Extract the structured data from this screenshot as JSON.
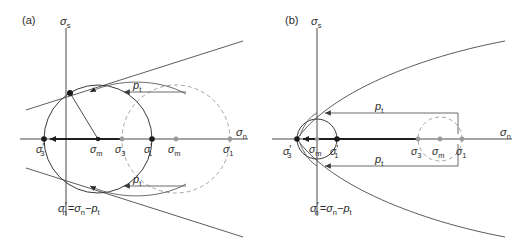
{
  "figure": {
    "background_color": "#ffffff",
    "ink_color": "#2b2b2b",
    "dashed_color": "#9a9a9a"
  },
  "panels": [
    {
      "id": "a",
      "label": "(a)",
      "envelope_type": "linear-coulomb",
      "axes": {
        "y_label_sigma": "σ",
        "y_label_sub": "s",
        "x_label_sigma": "σ",
        "x_label_sub": "n"
      },
      "equation": {
        "lhs_sigma": "σ",
        "lhs_sub": "n",
        "lhs_prime": "′",
        "eq": "=",
        "rhs_sigma": "σ",
        "rhs_sub": "n",
        "minus": "−",
        "p": "p",
        "p_sub": "t"
      },
      "shift_arrows": [
        {
          "name": "upper-pf-arrow",
          "label_p": "p",
          "label_sub": "t"
        },
        {
          "name": "lower-pf-arrow",
          "label_p": "p",
          "label_sub": "t"
        }
      ],
      "points": [
        {
          "name": "sigma-3-prime",
          "sigma": "σ",
          "sub": "3",
          "prime": "′",
          "style": "solid",
          "x": 44
        },
        {
          "name": "sigma-m-prime",
          "sigma": "σ",
          "sub": "m",
          "prime": "′",
          "style": "solid",
          "x": 98
        },
        {
          "name": "sigma-3",
          "sigma": "σ",
          "sub": "3",
          "prime": "",
          "style": "open",
          "x": 122
        },
        {
          "name": "sigma-1-prime",
          "sigma": "σ",
          "sub": "1",
          "prime": "′",
          "style": "solid",
          "x": 152
        },
        {
          "name": "sigma-m",
          "sigma": "σ",
          "sub": "m",
          "prime": "",
          "style": "open",
          "x": 176
        },
        {
          "name": "sigma-1",
          "sigma": "σ",
          "sub": "1",
          "prime": "",
          "style": "open",
          "x": 230
        }
      ]
    },
    {
      "id": "b",
      "label": "(b)",
      "envelope_type": "parabolic-griffith",
      "axes": {
        "y_label_sigma": "σ",
        "y_label_sub": "s",
        "x_label_sigma": "σ",
        "x_label_sub": "n"
      },
      "equation": {
        "lhs_sigma": "σ",
        "lhs_sub": "n",
        "lhs_prime": "′",
        "eq": "=",
        "rhs_sigma": "σ",
        "rhs_sub": "n",
        "minus": "−",
        "p": "p",
        "p_sub": "t"
      },
      "shift_arrows": [
        {
          "name": "upper-pf-arrow",
          "label_p": "p",
          "label_sub": "t"
        },
        {
          "name": "lower-pf-arrow",
          "label_p": "p",
          "label_sub": "t"
        }
      ],
      "points": [
        {
          "name": "sigma-3-prime",
          "sigma": "σ",
          "sub": "3",
          "prime": "′",
          "style": "solid",
          "x": 297
        },
        {
          "name": "sigma-m-prime",
          "sigma": "σ",
          "sub": "m",
          "prime": "′",
          "style": "open",
          "x": 317
        },
        {
          "name": "sigma-1-prime",
          "sigma": "σ",
          "sub": "1",
          "prime": "′",
          "style": "solid",
          "x": 337
        },
        {
          "name": "sigma-3",
          "sigma": "σ",
          "sub": "3",
          "prime": "",
          "style": "open",
          "x": 418
        },
        {
          "name": "sigma-m",
          "sigma": "σ",
          "sub": "m",
          "prime": "",
          "style": "open",
          "x": 440
        },
        {
          "name": "sigma-1",
          "sigma": "σ",
          "sub": "1",
          "prime": "",
          "style": "open",
          "x": 462
        }
      ]
    }
  ]
}
